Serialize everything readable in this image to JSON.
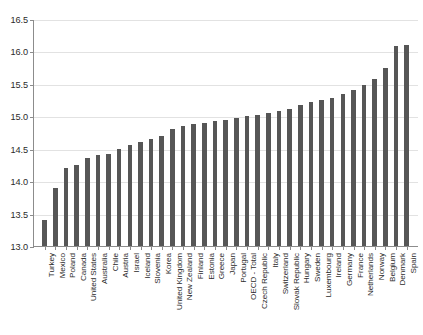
{
  "chart_data": {
    "type": "bar",
    "title": "",
    "subtitle": "",
    "xlabel": "",
    "ylabel": "",
    "ylim": [
      13.0,
      16.5
    ],
    "ytick_values": [
      13.0,
      13.5,
      14.0,
      14.5,
      15.0,
      15.5,
      16.0,
      16.5
    ],
    "ytick_labels": [
      "13.0",
      "13.5",
      "14.0",
      "14.5",
      "15.0",
      "15.5",
      "16.0",
      "16.5"
    ],
    "grid": true,
    "legend": false,
    "bar_color": "#565656",
    "axis_color": "#8c8c8c",
    "gridline_color": "#e2e2e2",
    "categories": [
      "Turkey",
      "Mexico",
      "Poland",
      "Canada",
      "United States",
      "Australia",
      "Chile",
      "Austria",
      "Israel",
      "Iceland",
      "Slovenia",
      "Korea",
      "United Kingdom",
      "New Zealand",
      "Finland",
      "Estonia",
      "Greece",
      "Japan",
      "Portugal",
      "OECD - Total",
      "Czech Republic",
      "Italy",
      "Switzerland",
      "Slovak Republic",
      "Hungary",
      "Sweden",
      "Luxembourg",
      "Ireland",
      "Germany",
      "France",
      "Netherlands",
      "Norway",
      "Belgium",
      "Denmark",
      "Spain"
    ],
    "values": [
      13.4,
      13.9,
      14.2,
      14.25,
      14.35,
      14.4,
      14.42,
      14.5,
      14.55,
      14.6,
      14.65,
      14.7,
      14.8,
      14.85,
      14.88,
      14.9,
      14.92,
      14.95,
      14.97,
      15.0,
      15.02,
      15.05,
      15.08,
      15.12,
      15.18,
      15.22,
      15.25,
      15.28,
      15.35,
      15.4,
      15.48,
      15.58,
      15.75,
      16.08,
      16.1
    ]
  }
}
